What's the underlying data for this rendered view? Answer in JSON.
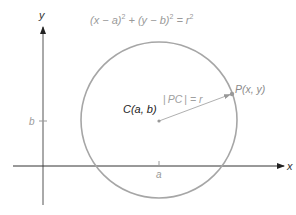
{
  "diagram": {
    "title_equation": {
      "parts": [
        "(x − a)",
        "2",
        " + (y − b)",
        "2",
        " = r",
        "2"
      ]
    },
    "axes": {
      "x_label": "x",
      "y_label": "y",
      "x_tick_label": "a",
      "y_tick_label": "b"
    },
    "center": {
      "label": "C(a, b)"
    },
    "point": {
      "label": "P(x, y)"
    },
    "radius": {
      "label_bar_left": "|",
      "label_text": "PC",
      "label_bar_right": "|",
      "label_eq": " = r"
    },
    "colors": {
      "axis": "#333333",
      "circle": "#a6a6a6",
      "radius_line": "#b0b0b0",
      "faint_text": "#9a9a9a",
      "dark_text": "#222222"
    }
  }
}
